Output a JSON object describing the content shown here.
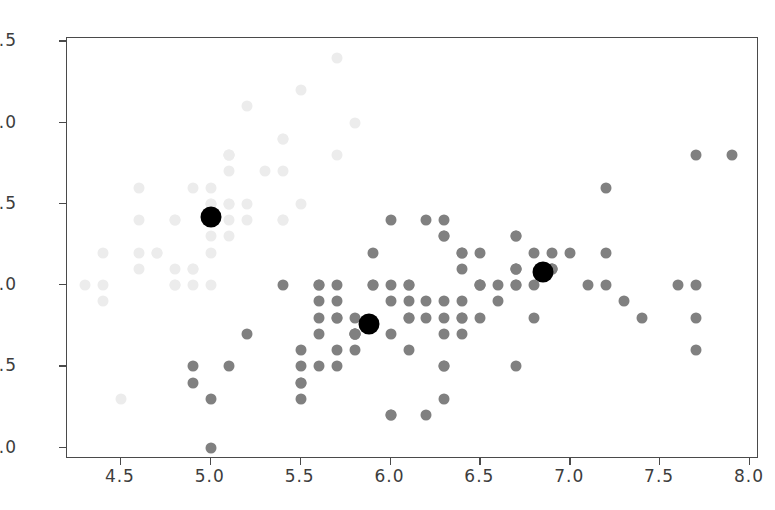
{
  "chart_data": {
    "type": "scatter",
    "title": "",
    "xlabel": "",
    "ylabel": "",
    "xlim": [
      4.2,
      8.05
    ],
    "ylim": [
      1.93,
      4.52
    ],
    "xticks": [
      4.5,
      5.0,
      5.5,
      6.0,
      6.5,
      7.0,
      7.5,
      8.0
    ],
    "yticks": [
      2.0,
      2.5,
      3.0,
      3.5,
      4.0,
      4.5
    ],
    "xticklabels": [
      "4.5",
      "5.0",
      "5.5",
      "6.0",
      "6.5",
      "7.0",
      "7.5",
      "8.0"
    ],
    "yticklabels": [
      "2.0",
      "2.5",
      "3.0",
      "3.5",
      "4.0",
      "4.5"
    ],
    "grid": false,
    "legend": null,
    "colors": {
      "cluster_light": "#ececec",
      "cluster_dark": "#808080",
      "centroid": "#000000",
      "axis": "#4a4a4a",
      "background": "#ffffff"
    },
    "marker_size_points": 11,
    "centroid_size_points": 21,
    "series": [
      {
        "name": "cluster-0",
        "color": "#ececec",
        "points": [
          [
            5.1,
            3.5
          ],
          [
            4.9,
            3.0
          ],
          [
            4.7,
            3.2
          ],
          [
            4.6,
            3.1
          ],
          [
            5.0,
            3.6
          ],
          [
            5.4,
            3.9
          ],
          [
            4.6,
            3.4
          ],
          [
            5.0,
            3.4
          ],
          [
            4.4,
            2.9
          ],
          [
            4.9,
            3.1
          ],
          [
            5.4,
            3.7
          ],
          [
            4.8,
            3.4
          ],
          [
            4.8,
            3.0
          ],
          [
            4.3,
            3.0
          ],
          [
            5.8,
            4.0
          ],
          [
            5.7,
            4.4
          ],
          [
            5.4,
            3.9
          ],
          [
            5.1,
            3.5
          ],
          [
            5.7,
            3.8
          ],
          [
            5.1,
            3.8
          ],
          [
            5.4,
            3.4
          ],
          [
            5.1,
            3.7
          ],
          [
            4.6,
            3.6
          ],
          [
            5.1,
            3.3
          ],
          [
            4.8,
            3.4
          ],
          [
            5.0,
            3.0
          ],
          [
            5.0,
            3.4
          ],
          [
            5.2,
            3.5
          ],
          [
            5.2,
            3.4
          ],
          [
            4.7,
            3.2
          ],
          [
            4.8,
            3.1
          ],
          [
            5.4,
            3.4
          ],
          [
            5.2,
            4.1
          ],
          [
            5.5,
            4.2
          ],
          [
            4.9,
            3.1
          ],
          [
            5.0,
            3.2
          ],
          [
            5.5,
            3.5
          ],
          [
            4.9,
            3.6
          ],
          [
            4.4,
            3.0
          ],
          [
            5.1,
            3.4
          ],
          [
            5.0,
            3.5
          ],
          [
            4.5,
            2.3
          ],
          [
            4.4,
            3.2
          ],
          [
            5.0,
            3.5
          ],
          [
            5.1,
            3.8
          ],
          [
            4.8,
            3.0
          ],
          [
            5.1,
            3.8
          ],
          [
            4.6,
            3.2
          ],
          [
            5.3,
            3.7
          ],
          [
            5.0,
            3.3
          ]
        ]
      },
      {
        "name": "cluster-1",
        "color": "#808080",
        "points": [
          [
            7.0,
            3.2
          ],
          [
            6.4,
            3.2
          ],
          [
            6.9,
            3.1
          ],
          [
            5.5,
            2.3
          ],
          [
            6.5,
            2.8
          ],
          [
            5.7,
            2.8
          ],
          [
            6.3,
            3.3
          ],
          [
            4.9,
            2.4
          ],
          [
            6.6,
            2.9
          ],
          [
            5.2,
            2.7
          ],
          [
            5.0,
            2.0
          ],
          [
            5.9,
            3.0
          ],
          [
            6.0,
            2.2
          ],
          [
            6.1,
            2.9
          ],
          [
            5.6,
            2.9
          ],
          [
            6.7,
            3.1
          ],
          [
            5.6,
            3.0
          ],
          [
            5.8,
            2.7
          ],
          [
            6.2,
            2.2
          ],
          [
            5.6,
            2.5
          ],
          [
            5.9,
            3.2
          ],
          [
            6.1,
            2.8
          ],
          [
            6.3,
            2.5
          ],
          [
            6.1,
            2.8
          ],
          [
            6.4,
            2.9
          ],
          [
            6.6,
            3.0
          ],
          [
            6.8,
            2.8
          ],
          [
            6.7,
            3.0
          ],
          [
            6.0,
            2.9
          ],
          [
            5.7,
            2.6
          ],
          [
            5.5,
            2.4
          ],
          [
            5.5,
            2.4
          ],
          [
            5.8,
            2.7
          ],
          [
            6.0,
            2.7
          ],
          [
            5.4,
            3.0
          ],
          [
            6.0,
            3.4
          ],
          [
            6.7,
            3.1
          ],
          [
            6.3,
            2.3
          ],
          [
            5.6,
            3.0
          ],
          [
            5.5,
            2.5
          ],
          [
            5.5,
            2.6
          ],
          [
            6.1,
            3.0
          ],
          [
            5.8,
            2.6
          ],
          [
            5.0,
            2.3
          ],
          [
            5.6,
            2.7
          ],
          [
            5.7,
            3.0
          ],
          [
            5.7,
            2.9
          ],
          [
            6.2,
            2.9
          ],
          [
            5.1,
            2.5
          ],
          [
            5.7,
            2.8
          ],
          [
            6.3,
            3.3
          ],
          [
            5.8,
            2.7
          ],
          [
            7.1,
            3.0
          ],
          [
            6.3,
            2.9
          ],
          [
            6.5,
            3.0
          ],
          [
            7.6,
            3.0
          ],
          [
            4.9,
            2.5
          ],
          [
            7.3,
            2.9
          ],
          [
            6.7,
            2.5
          ],
          [
            7.2,
            3.6
          ],
          [
            6.5,
            3.2
          ],
          [
            6.4,
            2.7
          ],
          [
            6.8,
            3.0
          ],
          [
            5.7,
            2.5
          ],
          [
            5.8,
            2.8
          ],
          [
            6.4,
            3.2
          ],
          [
            6.5,
            3.0
          ],
          [
            7.7,
            3.8
          ],
          [
            7.7,
            2.6
          ],
          [
            6.0,
            2.2
          ],
          [
            6.9,
            3.2
          ],
          [
            5.6,
            2.8
          ],
          [
            7.7,
            2.8
          ],
          [
            6.3,
            2.7
          ],
          [
            6.7,
            3.3
          ],
          [
            7.2,
            3.2
          ],
          [
            6.2,
            2.8
          ],
          [
            6.1,
            3.0
          ],
          [
            6.4,
            2.8
          ],
          [
            7.2,
            3.0
          ],
          [
            7.4,
            2.8
          ],
          [
            7.9,
            3.8
          ],
          [
            6.4,
            2.8
          ],
          [
            6.3,
            2.8
          ],
          [
            6.1,
            2.6
          ],
          [
            7.7,
            3.0
          ],
          [
            6.3,
            3.4
          ],
          [
            6.4,
            3.1
          ],
          [
            6.0,
            3.0
          ],
          [
            6.9,
            3.1
          ],
          [
            6.7,
            3.1
          ],
          [
            6.9,
            3.1
          ],
          [
            5.8,
            2.7
          ],
          [
            6.8,
            3.2
          ],
          [
            6.7,
            3.3
          ],
          [
            6.7,
            3.0
          ],
          [
            6.3,
            2.5
          ],
          [
            6.5,
            3.0
          ],
          [
            6.2,
            3.4
          ],
          [
            5.9,
            3.0
          ]
        ]
      }
    ],
    "centroids": {
      "name": "cluster-centers",
      "color": "#000000",
      "points": [
        [
          5.0,
          3.42
        ],
        [
          5.88,
          2.76
        ],
        [
          6.85,
          3.08
        ]
      ]
    }
  }
}
